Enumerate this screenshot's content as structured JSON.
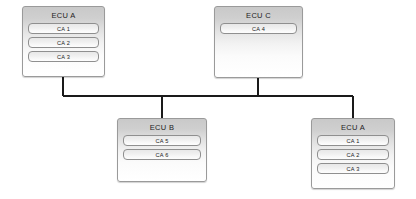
{
  "diagram": {
    "bus": {
      "color": "#1a1a1a",
      "label": "communication-bus"
    },
    "nodes": [
      {
        "id": "ecu-a-top-left",
        "title": "ECU A",
        "components": [
          "CA 1",
          "CA 2",
          "CA 3"
        ],
        "x": 22,
        "y": 6,
        "w": 83,
        "h": 71,
        "drop": {
          "x": 63,
          "from": "bottom"
        }
      },
      {
        "id": "ecu-c-top-right",
        "title": "ECU C",
        "components": [
          "CA 4"
        ],
        "x": 214,
        "y": 6,
        "w": 89,
        "h": 72,
        "drop": {
          "x": 258,
          "from": "bottom"
        }
      },
      {
        "id": "ecu-b-bottom-left",
        "title": "ECU B",
        "components": [
          "CA 5",
          "CA 6"
        ],
        "x": 117,
        "y": 118,
        "w": 90,
        "h": 64,
        "drop": {
          "x": 162,
          "from": "top"
        }
      },
      {
        "id": "ecu-a-bottom-right",
        "title": "ECU A",
        "components": [
          "CA 1",
          "CA 2",
          "CA 3"
        ],
        "x": 311,
        "y": 118,
        "w": 84,
        "h": 71,
        "drop": {
          "x": 353,
          "from": "top"
        }
      }
    ],
    "bus_line": {
      "x1": 63,
      "x2": 353,
      "y": 96
    }
  }
}
